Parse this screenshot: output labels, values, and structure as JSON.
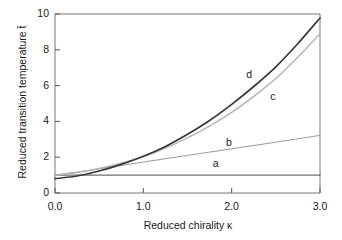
{
  "chart_data": {
    "type": "line",
    "title": "",
    "xlabel": "Reduced chirality κ",
    "ylabel": "Reduced  transition temperature t̄",
    "xlim": [
      0.0,
      3.0
    ],
    "ylim": [
      0,
      10
    ],
    "xticks": [
      "0.0",
      "1.0",
      "2.0",
      "3.0"
    ],
    "xtick_values": [
      0.0,
      1.0,
      2.0,
      3.0
    ],
    "yticks": [
      "0",
      "2",
      "4",
      "6",
      "8",
      "10"
    ],
    "ytick_values": [
      0,
      2,
      4,
      6,
      8,
      10
    ],
    "grid": false,
    "legend_position": "inline-annotations",
    "series": [
      {
        "name": "a",
        "label": "a",
        "color": "#4a4a4a",
        "width": 1.0,
        "label_x": 1.82,
        "label_y": 1.62,
        "x": [
          0.0,
          0.5,
          1.0,
          1.5,
          2.0,
          2.5,
          3.0
        ],
        "values": [
          1.0,
          1.0,
          1.0,
          1.0,
          1.0,
          1.0,
          1.0
        ]
      },
      {
        "name": "b",
        "label": "b",
        "color": "#9a9a9a",
        "width": 1.0,
        "label_x": 1.97,
        "label_y": 2.78,
        "x": [
          0.0,
          0.5,
          1.0,
          1.5,
          2.0,
          2.5,
          3.0
        ],
        "values": [
          1.0,
          1.35,
          1.73,
          2.1,
          2.47,
          2.84,
          3.22
        ]
      },
      {
        "name": "c",
        "label": "c",
        "color": "#b5b5b5",
        "width": 1.5,
        "label_x": 2.47,
        "label_y": 5.35,
        "x": [
          0.0,
          0.25,
          0.5,
          0.75,
          1.0,
          1.25,
          1.5,
          1.75,
          2.0,
          2.25,
          2.5,
          2.75,
          3.0
        ],
        "values": [
          1.0,
          1.14,
          1.37,
          1.66,
          2.02,
          2.51,
          3.08,
          3.74,
          4.5,
          5.4,
          6.4,
          7.6,
          8.9
        ]
      },
      {
        "name": "d",
        "label": "d",
        "color": "#383838",
        "width": 1.7,
        "label_x": 2.2,
        "label_y": 6.62,
        "x": [
          0.0,
          0.25,
          0.5,
          0.75,
          1.0,
          1.25,
          1.5,
          1.75,
          2.0,
          2.25,
          2.5,
          2.75,
          3.0
        ],
        "values": [
          0.8,
          0.95,
          1.23,
          1.6,
          2.05,
          2.6,
          3.28,
          4.05,
          4.95,
          5.95,
          7.05,
          8.35,
          9.78
        ]
      }
    ]
  },
  "axis": {
    "tick_color": "#555555",
    "frame_color": "#777777"
  }
}
